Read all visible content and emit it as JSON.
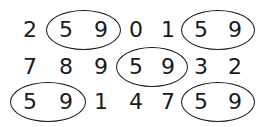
{
  "diagram": {
    "rows": [
      [
        "2",
        "5",
        "9",
        "0",
        "1",
        "5",
        "9"
      ],
      [
        "7",
        "8",
        "9",
        "5",
        "9",
        "3",
        "2"
      ],
      [
        "5",
        "9",
        "1",
        "4",
        "7",
        "5",
        "9"
      ]
    ],
    "highlighted_pair": [
      "5",
      "9"
    ],
    "circled_groups": [
      {
        "row": 0,
        "cols": [
          1,
          2
        ]
      },
      {
        "row": 0,
        "cols": [
          5,
          6
        ]
      },
      {
        "row": 1,
        "cols": [
          3,
          4
        ]
      },
      {
        "row": 2,
        "cols": [
          0,
          1
        ]
      },
      {
        "row": 2,
        "cols": [
          5,
          6
        ]
      }
    ],
    "colors": {
      "ink": "#1a1a1a",
      "background": "#ffffff"
    }
  }
}
